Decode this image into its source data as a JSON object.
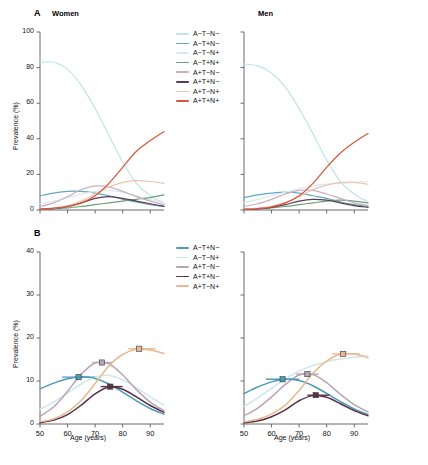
{
  "figure": {
    "caption_partial": "",
    "x_axis_label": "Age (years)",
    "y_axis_label": "Prevalence (%)"
  },
  "panels": [
    {
      "letter": "A",
      "title_left": "Women",
      "title_right": "Men"
    },
    {
      "letter": "B",
      "title_left": "",
      "title_right": ""
    }
  ],
  "colors": {
    "A-T-N-": "#bfe3e8",
    "A-T+N-": "#5fa8c4",
    "A-T-N+": "#d9e8f0",
    "A-T+N+": "#6f9e7a",
    "A+T-N-": "#c9aebe",
    "A+T+N-": "#5b3a52",
    "A+T-N+": "#f0c3ae",
    "A+T+N+": "#d4563c",
    "panelB_A-T+N-": "#4a9ab8",
    "panelB_A-T-N+": "#cfe6ea",
    "panelB_A+T-N-": "#b9a4b4",
    "panelB_A+T+N-": "#5b2f44",
    "panelB_A+T-N+": "#e8b893"
  },
  "legend_a": {
    "items": [
      {
        "label": "A−T−N−",
        "color": "#bfe3e8"
      },
      {
        "label": "A−T+N−",
        "color": "#5fa8c4"
      },
      {
        "label": "A−T−N+",
        "color": "#d9e8f0"
      },
      {
        "label": "A−T+N+",
        "color": "#6f9e7a"
      },
      {
        "label": "A+T−N−",
        "color": "#c9aebe"
      },
      {
        "label": "A+T+N−",
        "color": "#5b3a52"
      },
      {
        "label": "A+T−N+",
        "color": "#f0c3ae"
      },
      {
        "label": "A+T+N+",
        "color": "#d4563c"
      }
    ]
  },
  "legend_b": {
    "items": [
      {
        "label": "A−T+N−",
        "color": "#4a9ab8"
      },
      {
        "label": "A−T−N+",
        "color": "#cfe6ea"
      },
      {
        "label": "A+T−N−",
        "color": "#b9a4b4"
      },
      {
        "label": "A+T+N−",
        "color": "#5b2f44"
      },
      {
        "label": "A+T−N+",
        "color": "#e8b893"
      }
    ]
  },
  "chart_data": {
    "type": "line",
    "xlabel": "Age (years)",
    "ylabel": "Prevalence (%)",
    "x": [
      50,
      55,
      60,
      65,
      70,
      75,
      80,
      85,
      90,
      95
    ],
    "xlim": [
      50,
      95
    ],
    "xticks": [
      50,
      60,
      70,
      80,
      90
    ],
    "grid": false,
    "legend_position": "top-center-between-panels",
    "panels": [
      {
        "panel": "A",
        "ylim": [
          0,
          100
        ],
        "yticks": [
          0,
          20,
          40,
          60,
          80,
          100
        ],
        "subplots": [
          {
            "name": "Women",
            "series": [
              {
                "name": "A−T−N−",
                "color": "#bfe3e8",
                "values": [
                  83,
                  83,
                  79,
                  70,
                  57,
                  42,
                  27,
                  15,
                  8,
                  4
                ]
              },
              {
                "name": "A−T+N−",
                "color": "#5fa8c4",
                "values": [
                  8,
                  9.5,
                  10.5,
                  10.5,
                  9.5,
                  8,
                  6,
                  4.5,
                  3,
                  2
                ]
              },
              {
                "name": "A−T−N+",
                "color": "#d9e8f0",
                "values": [
                  3.5,
                  5,
                  7,
                  9,
                  10.5,
                  11,
                  10,
                  8,
                  6,
                  4
                ]
              },
              {
                "name": "A−T+N+",
                "color": "#6f9e7a",
                "values": [
                  0.5,
                  0.8,
                  1.2,
                  2,
                  3,
                  4,
                  5,
                  6,
                  7,
                  8.5
                ]
              },
              {
                "name": "A+T−N−",
                "color": "#c9aebe",
                "values": [
                  2,
                  4,
                  7.5,
                  11.5,
                  13.5,
                  13,
                  10.5,
                  7.5,
                  5,
                  3
                ]
              },
              {
                "name": "A+T+N−",
                "color": "#5b3a52",
                "values": [
                  0.3,
                  0.8,
                  2,
                  4,
                  6.5,
                  7.5,
                  6.5,
                  5,
                  3.5,
                  2
                ]
              },
              {
                "name": "A+T−N+",
                "color": "#f0c3ae",
                "values": [
                  0.5,
                  1,
                  2.5,
                  5,
                  9,
                  13,
                  15.5,
                  16.5,
                  16,
                  15
                ]
              },
              {
                "name": "A+T+N+",
                "color": "#d4563c",
                "values": [
                  0.5,
                  1,
                  2,
                  4,
                  8,
                  15,
                  24,
                  33,
                  39,
                  44
                ]
              }
            ]
          },
          {
            "name": "Men",
            "series": [
              {
                "name": "A−T−N−",
                "color": "#bfe3e8",
                "values": [
                  82,
                  81,
                  77,
                  69,
                  57,
                  43,
                  28,
                  16,
                  9,
                  4.5
                ]
              },
              {
                "name": "A−T+N−",
                "color": "#5fa8c4",
                "values": [
                  7,
                  8.5,
                  9.5,
                  10,
                  9.5,
                  8,
                  6.5,
                  4.5,
                  3,
                  2
                ]
              },
              {
                "name": "A−T−N+",
                "color": "#d9e8f0",
                "values": [
                  4,
                  6,
                  8,
                  10,
                  12,
                  13.5,
                  14.5,
                  15,
                  15.5,
                  16
                ]
              },
              {
                "name": "A−T+N+",
                "color": "#6f9e7a",
                "values": [
                  0.5,
                  0.8,
                  1.2,
                  2,
                  3,
                  4,
                  5,
                  5.5,
                  5,
                  4
                ]
              },
              {
                "name": "A+T−N−",
                "color": "#c9aebe",
                "values": [
                  2,
                  3.5,
                  6,
                  9,
                  11,
                  11,
                  9,
                  6.5,
                  4,
                  2.5
                ]
              },
              {
                "name": "A+T+N−",
                "color": "#5b3a52",
                "values": [
                  0.3,
                  0.6,
                  1.5,
                  3,
                  5,
                  6,
                  5.5,
                  4,
                  2.5,
                  1.5
                ]
              },
              {
                "name": "A+T−N+",
                "color": "#f0c3ae",
                "values": [
                  0.5,
                  1,
                  2,
                  4,
                  7.5,
                  11.5,
                  14,
                  15.5,
                  15.5,
                  14.5
                ]
              },
              {
                "name": "A+T+N+",
                "color": "#d4563c",
                "values": [
                  0.4,
                  0.8,
                  1.8,
                  4,
                  8,
                  15,
                  24,
                  32,
                  38,
                  43
                ]
              }
            ]
          }
        ]
      },
      {
        "panel": "B",
        "ylim": [
          0,
          40
        ],
        "yticks": [
          0,
          10,
          20,
          30,
          40
        ],
        "subplots": [
          {
            "name": "Women",
            "series": [
              {
                "name": "A−T+N−",
                "color": "#4a9ab8",
                "values": [
                  8.2,
                  9.5,
                  10.5,
                  11.0,
                  10.6,
                  9.3,
                  7.4,
                  5.4,
                  3.6,
                  2.3
                ],
                "peak": {
                  "x": 64,
                  "y": 10.9,
                  "err_low": 58,
                  "err_high": 70
                }
              },
              {
                "name": "A−T−N+",
                "color": "#cfe6ea",
                "values": [
                  3.4,
                  5.1,
                  7.2,
                  9.3,
                  10.9,
                  11.3,
                  10.3,
                  8.4,
                  6.3,
                  4.4
                ],
                "peak": null
              },
              {
                "name": "A+T−N−",
                "color": "#b9a4b4",
                "values": [
                  1.8,
                  4.0,
                  7.6,
                  11.6,
                  14.2,
                  14.0,
                  11.4,
                  8.0,
                  5.1,
                  3.1
                ],
                "peak": {
                  "x": 72.5,
                  "y": 14.3,
                  "err_low": 69,
                  "err_high": 76
                }
              },
              {
                "name": "A+T+N−",
                "color": "#5b2f44",
                "values": [
                  0.3,
                  0.9,
                  2.2,
                  4.4,
                  7.0,
                  8.6,
                  8.1,
                  6.3,
                  4.3,
                  2.7
                ],
                "peak": {
                  "x": 75.5,
                  "y": 8.7,
                  "err_low": 72,
                  "err_high": 80
                }
              },
              {
                "name": "A+T−N+",
                "color": "#e8b893",
                "values": [
                  0.5,
                  1.2,
                  2.8,
                  5.5,
                  9.4,
                  13.5,
                  16.2,
                  17.4,
                  17.2,
                  16.4
                ],
                "peak": {
                  "x": 86,
                  "y": 17.5,
                  "err_low": 82,
                  "err_high": 92
                }
              }
            ]
          },
          {
            "name": "Men",
            "series": [
              {
                "name": "A−T+N−",
                "color": "#4a9ab8",
                "values": [
                  7.1,
                  8.6,
                  9.8,
                  10.4,
                  10.1,
                  8.9,
                  7.1,
                  5.2,
                  3.5,
                  2.2
                ],
                "peak": {
                  "x": 64,
                  "y": 10.4,
                  "err_low": 58,
                  "err_high": 70
                }
              },
              {
                "name": "A−T−N+",
                "color": "#cfe6ea",
                "values": [
                  4.1,
                  6.1,
                  8.3,
                  10.5,
                  12.3,
                  13.6,
                  14.5,
                  15.1,
                  15.5,
                  15.9
                ],
                "peak": null
              },
              {
                "name": "A+T−N−",
                "color": "#b9a4b4",
                "values": [
                  1.9,
                  3.7,
                  6.3,
                  9.2,
                  11.4,
                  11.5,
                  9.6,
                  6.9,
                  4.5,
                  2.8
                ],
                "peak": {
                  "x": 73,
                  "y": 11.6,
                  "err_low": 69,
                  "err_high": 77
                }
              },
              {
                "name": "A+T+N−",
                "color": "#5b2f44",
                "values": [
                  0.3,
                  0.7,
                  1.7,
                  3.3,
                  5.4,
                  6.6,
                  6.2,
                  4.7,
                  3.1,
                  1.9
                ],
                "peak": {
                  "x": 76,
                  "y": 6.7,
                  "err_low": 73,
                  "err_high": 81
                }
              },
              {
                "name": "A+T−N+",
                "color": "#e8b893",
                "values": [
                  0.5,
                  1.1,
                  2.3,
                  4.4,
                  7.8,
                  11.8,
                  14.6,
                  16.2,
                  16.3,
                  15.4
                ],
                "peak": {
                  "x": 86,
                  "y": 16.3,
                  "err_low": 82,
                  "err_high": 92
                }
              }
            ]
          }
        ]
      }
    ]
  }
}
